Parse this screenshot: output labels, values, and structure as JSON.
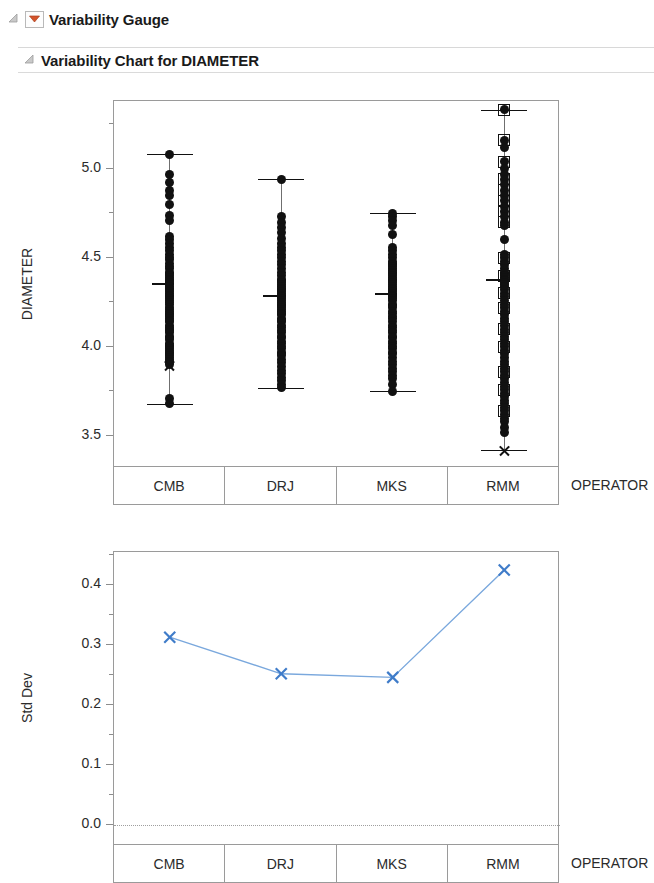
{
  "outline": {
    "gauge": {
      "title": "Variability Gauge",
      "disclosure_icon": "triangle-open-icon",
      "menu_icon": "red-triangle-menu-icon",
      "menu_color": "#d4542a"
    },
    "chart": {
      "title": "Variability Chart for DIAMETER",
      "disclosure_icon": "triangle-open-icon"
    }
  },
  "chart_data": [
    {
      "id": "variability-chart",
      "type": "scatter",
      "title": "Variability Chart for DIAMETER",
      "xlabel": "OPERATOR",
      "ylabel": "DIAMETER",
      "categories": [
        "CMB",
        "DRJ",
        "MKS",
        "RMM"
      ],
      "ylim": [
        3.32,
        5.38
      ],
      "yticks": [
        3.5,
        4.0,
        4.5,
        5.0
      ],
      "ytick_labels": [
        "3.5",
        "4.0",
        "4.5",
        "5.0"
      ],
      "yminor_ticks": [
        3.75,
        4.25,
        4.75,
        5.25
      ],
      "grid": false,
      "legend": "none",
      "marker_series": [
        {
          "name": "CMB",
          "group_max": 5.08,
          "group_min": 3.68,
          "group_mean_line": 4.36,
          "mean_marker": 3.9,
          "mean_marker_style": "x",
          "points": [
            5.08,
            4.97,
            4.92,
            4.88,
            4.85,
            4.8,
            4.74,
            4.71,
            4.62,
            4.6,
            4.58,
            4.56,
            4.54,
            4.52,
            4.5,
            4.49,
            4.47,
            4.45,
            4.44,
            4.42,
            4.41,
            4.4,
            4.39,
            4.38,
            4.37,
            4.36,
            4.35,
            4.34,
            4.33,
            4.32,
            4.31,
            4.3,
            4.29,
            4.28,
            4.27,
            4.26,
            4.25,
            4.24,
            4.22,
            4.21,
            4.2,
            4.19,
            4.18,
            4.17,
            4.16,
            4.15,
            4.14,
            4.12,
            4.11,
            4.1,
            4.09,
            4.08,
            4.06,
            4.05,
            4.04,
            4.02,
            4.01,
            4.0,
            3.99,
            3.98,
            3.97,
            3.96,
            3.95,
            3.94,
            3.93,
            3.92,
            3.91,
            3.9,
            3.71,
            3.68
          ],
          "square_points": []
        },
        {
          "name": "DRJ",
          "group_max": 4.94,
          "group_min": 3.77,
          "group_mean_line": 4.29,
          "mean_marker": null,
          "mean_marker_style": "none",
          "points": [
            4.94,
            4.73,
            4.7,
            4.67,
            4.64,
            4.61,
            4.58,
            4.56,
            4.54,
            4.52,
            4.5,
            4.48,
            4.46,
            4.44,
            4.42,
            4.4,
            4.38,
            4.37,
            4.36,
            4.35,
            4.34,
            4.33,
            4.32,
            4.31,
            4.3,
            4.29,
            4.28,
            4.27,
            4.26,
            4.25,
            4.24,
            4.23,
            4.22,
            4.21,
            4.2,
            4.19,
            4.18,
            4.16,
            4.15,
            4.14,
            4.12,
            4.11,
            4.09,
            4.08,
            4.06,
            4.05,
            4.03,
            4.02,
            4.0,
            3.99,
            3.97,
            3.96,
            3.95,
            3.93,
            3.91,
            3.89,
            3.87,
            3.85,
            3.83,
            3.81,
            3.79,
            3.77
          ],
          "square_points": []
        },
        {
          "name": "MKS",
          "group_max": 4.75,
          "group_min": 3.75,
          "group_mean_line": 4.3,
          "mean_marker": null,
          "mean_marker_style": "none",
          "points": [
            4.75,
            4.73,
            4.71,
            4.68,
            4.63,
            4.56,
            4.54,
            4.52,
            4.5,
            4.48,
            4.47,
            4.46,
            4.45,
            4.44,
            4.43,
            4.42,
            4.41,
            4.4,
            4.39,
            4.38,
            4.37,
            4.36,
            4.35,
            4.34,
            4.33,
            4.32,
            4.31,
            4.3,
            4.29,
            4.28,
            4.27,
            4.26,
            4.24,
            4.23,
            4.22,
            4.2,
            4.19,
            4.17,
            4.16,
            4.14,
            4.12,
            4.11,
            4.09,
            4.08,
            4.06,
            4.05,
            4.03,
            4.02,
            4.0,
            3.99,
            3.97,
            3.96,
            3.94,
            3.92,
            3.9,
            3.88,
            3.86,
            3.84,
            3.82,
            3.79,
            3.75
          ],
          "square_points": []
        },
        {
          "name": "RMM",
          "group_max": 5.33,
          "group_min": 3.42,
          "group_mean_line": 4.38,
          "mean_marker": 3.42,
          "mean_marker_style": "x",
          "points": [
            5.33,
            5.16,
            5.12,
            5.04,
            5.0,
            4.97,
            4.94,
            4.91,
            4.88,
            4.85,
            4.82,
            4.79,
            4.76,
            4.73,
            4.7,
            4.68,
            4.6,
            4.52,
            4.5,
            4.48,
            4.46,
            4.44,
            4.42,
            4.41,
            4.4,
            4.39,
            4.38,
            4.37,
            4.36,
            4.35,
            4.34,
            4.32,
            4.3,
            4.28,
            4.26,
            4.24,
            4.22,
            4.2,
            4.18,
            4.16,
            4.14,
            4.12,
            4.1,
            4.08,
            4.06,
            4.04,
            4.02,
            4.0,
            3.98,
            3.96,
            3.94,
            3.92,
            3.9,
            3.88,
            3.86,
            3.84,
            3.82,
            3.8,
            3.78,
            3.76,
            3.74,
            3.72,
            3.7,
            3.68,
            3.66,
            3.64,
            3.62,
            3.6,
            3.58,
            3.55,
            3.52
          ],
          "square_points": [
            5.33,
            5.16,
            5.04,
            4.94,
            4.88,
            4.82,
            4.76,
            4.7,
            4.5,
            4.4,
            4.3,
            4.22,
            4.1,
            4.0,
            3.86,
            3.76,
            3.64
          ]
        }
      ]
    },
    {
      "id": "std-dev-chart",
      "type": "line",
      "xlabel": "OPERATOR",
      "ylabel": "Std Dev",
      "categories": [
        "CMB",
        "DRJ",
        "MKS",
        "RMM"
      ],
      "values": [
        0.313,
        0.252,
        0.246,
        0.425
      ],
      "ylim": [
        -0.035,
        0.455
      ],
      "yticks": [
        0.0,
        0.1,
        0.2,
        0.3,
        0.4
      ],
      "ytick_labels": [
        "0.0",
        "0.1",
        "0.2",
        "0.3",
        "0.4"
      ],
      "yminor_ticks": [
        0.05,
        0.15,
        0.25,
        0.35,
        0.45
      ],
      "reference_line": 0.0,
      "reference_line_style": "dotted",
      "marker": "x",
      "line_color": "#7aa8dd",
      "marker_color": "#3f7cc9",
      "grid": false,
      "legend": "none"
    }
  ]
}
